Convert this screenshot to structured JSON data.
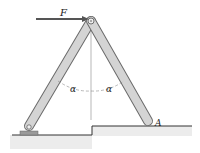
{
  "diagram": {
    "type": "statics-frame",
    "labels": {
      "force": "F",
      "angle_left": "α",
      "angle_right": "α",
      "point_a": "A"
    },
    "colors": {
      "bar_fill": "#d4d4d4",
      "bar_edge": "#6b6b6b",
      "arrow": "#555555",
      "ground_hatch": "#e6e6e6",
      "line": "#333333"
    }
  }
}
